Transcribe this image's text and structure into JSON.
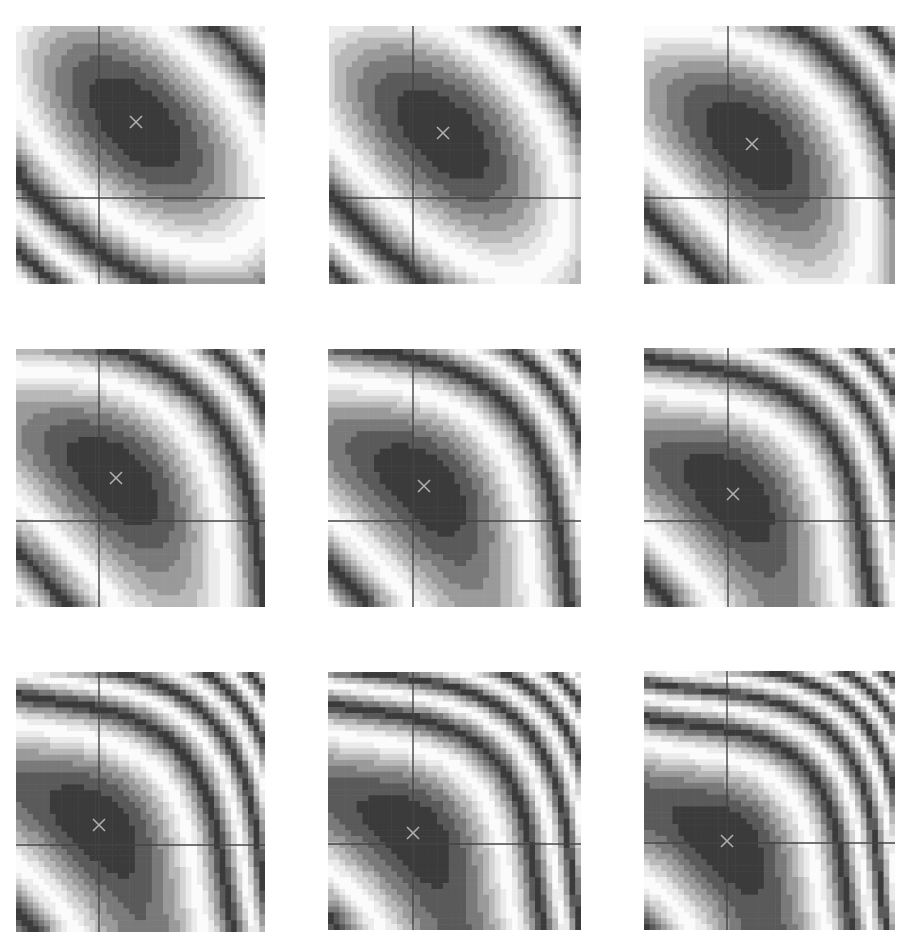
{
  "figure": {
    "layout": {
      "rows": 3,
      "cols": 3
    },
    "palette": [
      "#3b3b3b",
      "#5a5a5a",
      "#7a7a7a",
      "#9a9a9a",
      "#b8b8b8",
      "#d4d4d4",
      "#ebebeb",
      "#fbfbfb"
    ],
    "axis_color": "#444444",
    "marker_color": "#b0b0b0",
    "marker_symbol": "×"
  },
  "chart_data": {
    "type": "heatmap",
    "title": "",
    "xlabel": "",
    "ylabel": "",
    "description": "3x3 grid of filled contour plots (8 grayscale levels) with axes through the origin and the minimum marked by an x; contours evolve from tilted ellipses (top row) to rounded triangles (bottom row) as the minimum moves toward the origin",
    "grid": false,
    "legend": null,
    "panels": [
      {
        "row": 1,
        "col": 1,
        "box": [
          16,
          26,
          249,
          258
        ],
        "origin_px": [
          99,
          198
        ],
        "min_px": [
          136,
          122
        ],
        "shape": "tilted-ellipse",
        "cubic": 0.0
      },
      {
        "row": 1,
        "col": 2,
        "box": [
          329,
          26,
          252,
          258
        ],
        "origin_px": [
          413,
          198
        ],
        "min_px": [
          443,
          133
        ],
        "shape": "tilted-ellipse",
        "cubic": 0.15
      },
      {
        "row": 1,
        "col": 3,
        "box": [
          644,
          26,
          251,
          258
        ],
        "origin_px": [
          728,
          198
        ],
        "min_px": [
          752,
          144
        ],
        "shape": "tilted-ellipse",
        "cubic": 0.3
      },
      {
        "row": 2,
        "col": 1,
        "box": [
          16,
          349,
          249,
          258
        ],
        "origin_px": [
          99,
          521
        ],
        "min_px": [
          116,
          478
        ],
        "shape": "rounded-triangle",
        "cubic": 0.45
      },
      {
        "row": 2,
        "col": 2,
        "box": [
          328,
          349,
          253,
          258
        ],
        "origin_px": [
          413,
          521
        ],
        "min_px": [
          424,
          486
        ],
        "shape": "rounded-triangle",
        "cubic": 0.55
      },
      {
        "row": 2,
        "col": 3,
        "box": [
          644,
          348,
          251,
          259
        ],
        "origin_px": [
          728,
          521
        ],
        "min_px": [
          733,
          494
        ],
        "shape": "rounded-triangle",
        "cubic": 0.65
      },
      {
        "row": 3,
        "col": 1,
        "box": [
          16,
          672,
          249,
          260
        ],
        "origin_px": [
          99,
          845
        ],
        "min_px": [
          99,
          825
        ],
        "shape": "rounded-triangle",
        "cubic": 0.75
      },
      {
        "row": 3,
        "col": 2,
        "box": [
          328,
          672,
          253,
          258
        ],
        "origin_px": [
          413,
          844
        ],
        "min_px": [
          413,
          833
        ],
        "shape": "rounded-triangle",
        "cubic": 0.85
      },
      {
        "row": 3,
        "col": 3,
        "box": [
          644,
          671,
          251,
          259
        ],
        "origin_px": [
          727,
          843
        ],
        "min_px": [
          727,
          841
        ],
        "shape": "rounded-triangle",
        "cubic": 0.95
      }
    ]
  }
}
